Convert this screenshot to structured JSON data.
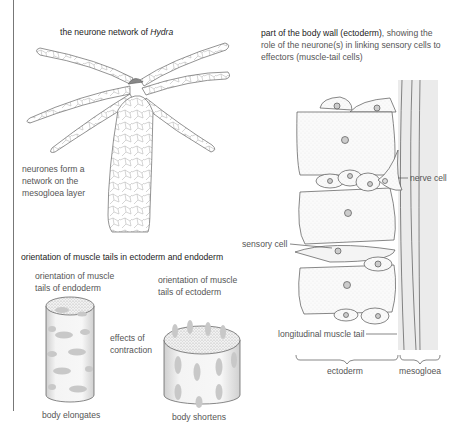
{
  "hydra_panel": {
    "title_prefix": "the neurone network of ",
    "title_species": "Hydra",
    "annotation": [
      "neurones form a",
      "network on the",
      "mesogloea layer"
    ]
  },
  "body_wall_panel": {
    "title_bold": "part of the body wall (ectoderm)",
    "title_rest_line1": ", showing the",
    "title_line2": "role of the neurone(s) in linking sensory cells to",
    "title_line3": "effectors (muscle-tail cells)",
    "labels": {
      "nerve_cell": "nerve cell",
      "sensory_cell": "sensory cell",
      "longitudinal_muscle_tail": "longitudinal muscle tail",
      "ectoderm": "ectoderm",
      "mesogloea": "mesogloea"
    }
  },
  "muscle_panel": {
    "title": "orientation of muscle tails in ectoderm and endoderm",
    "endoderm_label": [
      "orientation of muscle",
      "tails of endoderm"
    ],
    "ectoderm_label": [
      "orientation of muscle",
      "tails of ectoderm"
    ],
    "effects_label": [
      "effects of",
      "contraction"
    ],
    "endoderm_result": "body elongates",
    "ectoderm_result": "body shortens"
  },
  "colors": {
    "line": "#555555",
    "stipple": "#bdbdbd",
    "mesogloea_fill": "#eaeaea",
    "muscle_tail_fill": "#c8c8c8"
  }
}
